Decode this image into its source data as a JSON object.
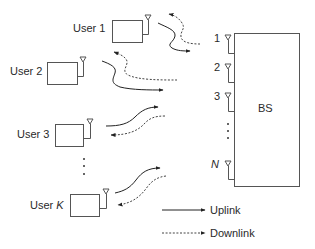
{
  "diagram": {
    "title": "",
    "base_station": {
      "label": "BS",
      "antennas": [
        {
          "label": "1"
        },
        {
          "label": "2"
        },
        {
          "label": "3"
        },
        {
          "label": "N"
        }
      ]
    },
    "users": [
      {
        "label": "User 1"
      },
      {
        "label": "User 2"
      },
      {
        "label": "User 3"
      },
      {
        "label_prefix": "User ",
        "label_var": "K"
      }
    ],
    "legend": {
      "uplink": "Uplink",
      "downlink": "Downlink"
    },
    "colors": {
      "line": "#555555",
      "text": "#2a2a2a",
      "background": "#ffffff"
    }
  }
}
